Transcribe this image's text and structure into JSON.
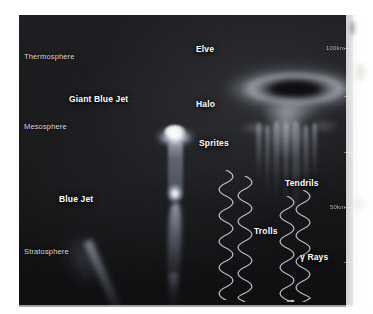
{
  "figure": {
    "background_color": "#151515",
    "label_color": "#ffffff",
    "axis_color": "#d9d9d9"
  },
  "atmosphere_layers": [
    {
      "name": "Thermosphere",
      "label": "Thermosphere",
      "x": 24,
      "y": 52
    },
    {
      "name": "Mesosphere",
      "label": "Mesosphere",
      "x": 24,
      "y": 122
    },
    {
      "name": "Stratosphere",
      "label": "Stratosphere",
      "x": 24,
      "y": 247
    }
  ],
  "altitude_scale": {
    "unit": "km",
    "markers": [
      {
        "label": "100km",
        "value": 100,
        "x": 326,
        "y": 45
      },
      {
        "label": "50km",
        "value": 50,
        "x": 330,
        "y": 204
      }
    ],
    "tick_positions_y": [
      18,
      42,
      70,
      96,
      124,
      152,
      180,
      208,
      236,
      264,
      288
    ]
  },
  "features": [
    {
      "name": "elve",
      "label": "Elve",
      "x": 196,
      "y": 44
    },
    {
      "name": "giant-blue-jet",
      "label": "Giant Blue Jet",
      "x": 69,
      "y": 94
    },
    {
      "name": "halo",
      "label": "Halo",
      "x": 196,
      "y": 99
    },
    {
      "name": "sprites",
      "label": "Sprites",
      "x": 199,
      "y": 138
    },
    {
      "name": "tendrils",
      "label": "Tendrils",
      "x": 285,
      "y": 178
    },
    {
      "name": "blue-jet",
      "label": "Blue Jet",
      "x": 59,
      "y": 194
    },
    {
      "name": "trolls",
      "label": "Trolls",
      "x": 254,
      "y": 226
    },
    {
      "name": "gamma-rays",
      "label": "γ Rays",
      "x": 300,
      "y": 252
    }
  ],
  "gamma_ray_streamers": [
    {
      "name": "streamer-1",
      "x": 218,
      "y": 170,
      "height": 130
    },
    {
      "name": "streamer-2",
      "x": 237,
      "y": 176,
      "height": 126
    },
    {
      "name": "streamer-3",
      "x": 279,
      "y": 196,
      "height": 106
    },
    {
      "name": "streamer-4",
      "x": 295,
      "y": 190,
      "height": 112
    }
  ]
}
